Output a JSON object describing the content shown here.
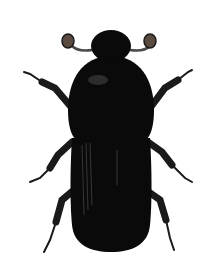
{
  "image": {
    "subject": "beetle illustration",
    "alt": "Black bark beetle illustration, dorsal view",
    "colors": {
      "background": "#ffffff",
      "body": "#0a0a0a",
      "highlight": "#3a3a3a",
      "legs": "#1a1a1a",
      "antenna_club": "#5a4a40"
    }
  }
}
